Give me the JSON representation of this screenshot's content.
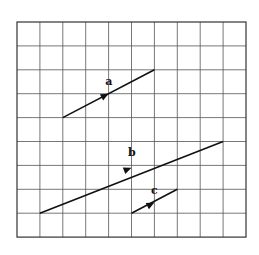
{
  "diagram": {
    "grid": {
      "columns": 10,
      "rows": 9,
      "origin_px": [
        17,
        22
      ],
      "cell_w": 22.9,
      "cell_h": 23.9,
      "line_color": "#555555",
      "border_color": "#333333"
    },
    "vectors": [
      {
        "label": "a",
        "from": [
          2,
          4
        ],
        "to": [
          6,
          2
        ],
        "arrow_at": [
          4,
          3
        ],
        "label_at": [
          3.85,
          2.62
        ]
      },
      {
        "label": "b",
        "from": [
          1,
          8
        ],
        "to": [
          9,
          5
        ],
        "arrow_at": [
          5.0,
          6.1
        ],
        "label_at": [
          4.85,
          5.62
        ]
      },
      {
        "label": "c",
        "from": [
          5,
          8
        ],
        "to": [
          7,
          7
        ],
        "arrow_at": [
          6.0,
          7.55
        ],
        "label_at": [
          5.85,
          7.2
        ]
      }
    ],
    "vector_color": "#111111"
  }
}
